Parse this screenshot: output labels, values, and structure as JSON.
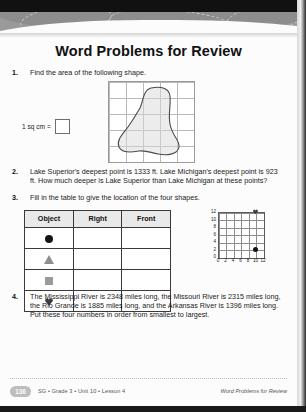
{
  "page": {
    "title": "Word Problems for Review"
  },
  "problems": [
    {
      "number": "1.",
      "text": "Find the area of the following shape.",
      "legend_label": "1 sq cm =",
      "answer_box_value": ""
    },
    {
      "number": "2.",
      "text": "Lake Superior's deepest point is 1333 ft. Lake Michigan's deepest point is 923 ft. How much deeper is Lake Superior than Lake Michigan at these points?"
    },
    {
      "number": "3.",
      "text": "Fill in the table to give the location of the four shapes."
    },
    {
      "number": "4.",
      "text": "The Mississippi River is 2348 miles long, the Missouri River is 2315 miles long, the Rio Grande is 1885 miles long, and the Arkansas River is 1396 miles long. Put these four numbers in order from smallest to largest."
    }
  ],
  "table": {
    "headers": [
      "Object",
      "Right",
      "Front"
    ],
    "rows": [
      {
        "shape": "circle",
        "right": "",
        "front": ""
      },
      {
        "shape": "triangle",
        "right": "",
        "front": ""
      },
      {
        "shape": "square",
        "right": "",
        "front": ""
      },
      {
        "shape": "heart",
        "right": "",
        "front": ""
      }
    ]
  },
  "chart_data": {
    "type": "scatter",
    "title": "",
    "xlabel": "",
    "ylabel": "",
    "xlim": [
      0,
      12
    ],
    "ylim": [
      0,
      12
    ],
    "xticks": [
      "0",
      "2",
      "4",
      "6",
      "8",
      "10",
      "12"
    ],
    "yticks": [
      "0",
      "2",
      "4",
      "6",
      "8",
      "10",
      "12"
    ],
    "grid": true,
    "legend": "none",
    "points": [
      {
        "shape": "triangle",
        "x": 2,
        "y": 10
      },
      {
        "shape": "heart",
        "x": 10,
        "y": 12
      },
      {
        "shape": "circle",
        "x": 10,
        "y": 2
      },
      {
        "shape": "square",
        "x": 6,
        "y": 0
      }
    ]
  },
  "area_grid": {
    "columns": 5,
    "rows": 5,
    "shape_label": "irregular-blob"
  },
  "footer": {
    "page_number": "136",
    "left": "SG • Grade 3 • Unit 10 • Lesson 4",
    "right": "Word Problems for Review"
  },
  "colors": {
    "ink": "#1b1b1b",
    "rule": "#3a3a3a",
    "header_fill": "#e9e9e9",
    "grid_line": "#8c8c8c",
    "shape_gray": "#9a9a9a",
    "shape_black": "#141414",
    "footer_text": "#555555",
    "page_badge": "#bdbdbd"
  }
}
